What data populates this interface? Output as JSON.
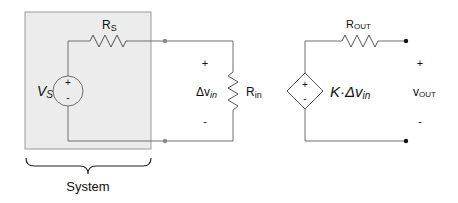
{
  "diagram": {
    "system_box": {
      "label": "System",
      "fill": "#ececec",
      "stroke": "#9a9a9a"
    },
    "source": {
      "name": "V",
      "subscript": "S",
      "plus": "+",
      "minus": "-"
    },
    "source_resistor": {
      "name": "R",
      "subscript": "S"
    },
    "input_resistor": {
      "name": "R",
      "subscript": "in"
    },
    "input_voltage": {
      "prefix": "Δv",
      "subscript": "in",
      "plus": "+",
      "minus": "-"
    },
    "dependent_source": {
      "plus": "+",
      "minus": "-",
      "gain_prefix": "K·Δv",
      "gain_subscript": "in"
    },
    "output_resistor": {
      "name": "R",
      "subscript": "OUT"
    },
    "output_voltage": {
      "name": "v",
      "subscript": "OUT",
      "plus": "+",
      "minus": "-"
    },
    "colors": {
      "wire": "#6e6e6e",
      "node_open": "#8a8a8a",
      "node_solid": "#111111",
      "text": "#111111"
    }
  }
}
